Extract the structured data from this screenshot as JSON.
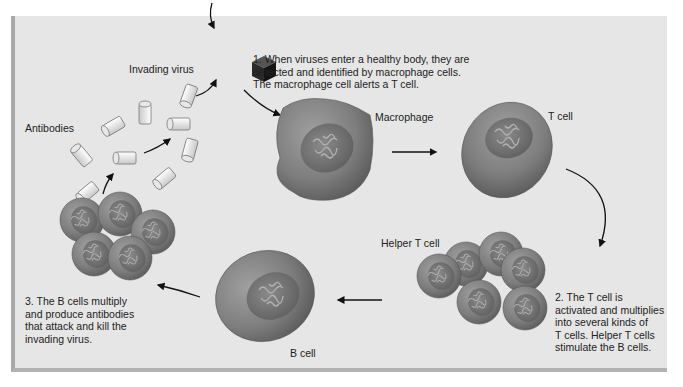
{
  "diagram": {
    "labels": {
      "invading_virus": "Invading virus",
      "antibodies": "Antibodies",
      "macrophage": "Macrophage",
      "t_cell": "T cell",
      "helper_t_cell": "Helper T cell",
      "b_cell": "B cell"
    },
    "steps": [
      {
        "number": "1.",
        "lines": [
          "1.  When viruses enter a healthy body, they are",
          "detected and identified by macrophage cells.",
          "The macrophage cell alerts a T cell."
        ]
      },
      {
        "number": "2.",
        "lines": [
          "2. The T cell is",
          "activated and multiplies",
          "into several kinds of",
          "T cells. Helper T cells",
          "stimulate the B cells."
        ]
      },
      {
        "number": "3.",
        "lines": [
          "3. The B cells multiply",
          "and produce antibodies",
          "that attack and kill the",
          "invading virus."
        ]
      }
    ],
    "flow": [
      "Invading virus",
      "Macrophage",
      "T cell",
      "Helper T cell",
      "B cell",
      "Antibodies",
      "Invading virus"
    ],
    "colors": {
      "background": "#e6e6e6",
      "panel_border": "#a9a9a9",
      "cell_fill": "#7a7a7a",
      "nucleus_fill": "#6a6a6a",
      "virus_fill": "#2b2b2b",
      "antibody_fill": "#f2f2f2",
      "arrow": "#111111"
    }
  }
}
